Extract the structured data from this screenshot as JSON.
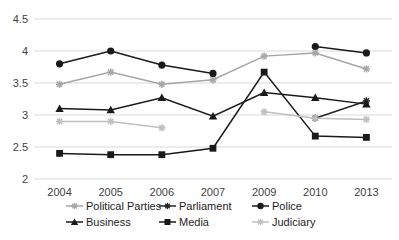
{
  "chart_data": {
    "type": "line",
    "title": "",
    "xlabel": "",
    "ylabel": "",
    "categories": [
      "2004",
      "2005",
      "2006",
      "2007",
      "2009",
      "2010",
      "2013"
    ],
    "ylim": [
      2,
      4.5
    ],
    "yticks": [
      "2",
      "2.5",
      "3",
      "3.5",
      "4",
      "4.5"
    ],
    "ytick_values": [
      2,
      2.5,
      3,
      3.5,
      4,
      4.5
    ],
    "grid": true,
    "legend_position": "bottom",
    "series": [
      {
        "name": "Political Parties",
        "marker": "asterisk",
        "color": "#a6a6a6",
        "values": [
          3.48,
          3.67,
          3.48,
          3.55,
          3.92,
          3.97,
          3.72
        ]
      },
      {
        "name": "Parliament",
        "marker": "asterisk",
        "color": "#262626",
        "values": [
          null,
          null,
          null,
          null,
          null,
          2.95,
          3.22
        ]
      },
      {
        "name": "Police",
        "marker": "circle",
        "color": "#1a1a1a",
        "values": [
          3.8,
          4.0,
          3.78,
          3.65,
          null,
          4.07,
          3.97
        ]
      },
      {
        "name": "Business",
        "marker": "triangle",
        "color": "#1a1a1a",
        "values": [
          3.1,
          3.08,
          3.27,
          2.98,
          3.35,
          3.27,
          3.17
        ]
      },
      {
        "name": "Media",
        "marker": "square",
        "color": "#1a1a1a",
        "values": [
          2.4,
          2.38,
          2.38,
          2.48,
          3.67,
          2.67,
          2.65
        ]
      },
      {
        "name": "Judiciary",
        "marker": "asterisk",
        "color": "#bfbfbf",
        "values": [
          2.9,
          2.9,
          2.8,
          null,
          3.05,
          2.95,
          2.93
        ]
      }
    ]
  },
  "legend": {
    "row1": [
      "Political Parties",
      "Parliament",
      "Police"
    ],
    "row2": [
      "Business",
      "Media",
      "Judiciary"
    ]
  }
}
